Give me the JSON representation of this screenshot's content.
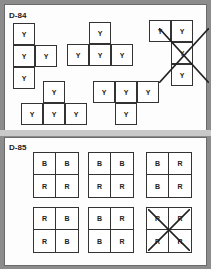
{
  "panels": [
    {
      "id": "D-84",
      "label": "D-84",
      "shapes": [
        {
          "name": "net-column-right-arm",
          "cells": [
            {
              "x": 13,
              "y": 23,
              "text": "Y"
            },
            {
              "x": 13,
              "y": 45,
              "text": "Y"
            },
            {
              "x": 35,
              "y": 45,
              "text": "Y"
            },
            {
              "x": 13,
              "y": 67,
              "text": "Y"
            }
          ],
          "crossed": false
        },
        {
          "name": "net-t-up-top",
          "cells": [
            {
              "x": 89,
              "y": 22,
              "text": "Y"
            },
            {
              "x": 67,
              "y": 44,
              "text": "Y"
            },
            {
              "x": 89,
              "y": 44,
              "text": "Y"
            },
            {
              "x": 111,
              "y": 44,
              "text": "Y"
            }
          ],
          "crossed": false
        },
        {
          "name": "net-crossed",
          "cells": [
            {
              "x": 149,
              "y": 20,
              "text": "Y"
            },
            {
              "x": 171,
              "y": 20,
              "text": "Y"
            },
            {
              "x": 171,
              "y": 42,
              "text": "Y"
            },
            {
              "x": 171,
              "y": 64,
              "text": "Y"
            }
          ],
          "crossed": true
        },
        {
          "name": "net-t-up-bottom",
          "cells": [
            {
              "x": 43,
              "y": 81,
              "text": "Y"
            },
            {
              "x": 21,
              "y": 103,
              "text": "Y"
            },
            {
              "x": 43,
              "y": 103,
              "text": "Y"
            },
            {
              "x": 65,
              "y": 103,
              "text": "Y"
            }
          ],
          "crossed": false
        },
        {
          "name": "net-t-down",
          "cells": [
            {
              "x": 93,
              "y": 81,
              "text": "Y"
            },
            {
              "x": 115,
              "y": 81,
              "text": "Y"
            },
            {
              "x": 137,
              "y": 81,
              "text": "Y"
            },
            {
              "x": 115,
              "y": 103,
              "text": "Y"
            }
          ],
          "crossed": false
        }
      ]
    },
    {
      "id": "D-85",
      "label": "D-85",
      "squares": [
        {
          "x": 33,
          "y": 152,
          "cells": [
            "B",
            "B",
            "R",
            "R"
          ],
          "crossed": false
        },
        {
          "x": 88,
          "y": 152,
          "cells": [
            "B",
            "B",
            "R",
            "R"
          ],
          "crossed": false
        },
        {
          "x": 146,
          "y": 152,
          "cells": [
            "B",
            "R",
            "B",
            "R"
          ],
          "crossed": false
        },
        {
          "x": 33,
          "y": 207,
          "cells": [
            "R",
            "B",
            "R",
            "B"
          ],
          "crossed": false
        },
        {
          "x": 88,
          "y": 207,
          "cells": [
            "B",
            "R",
            "B",
            "R"
          ],
          "crossed": false
        },
        {
          "x": 146,
          "y": 207,
          "cells": [
            "R",
            "R",
            "R",
            "R"
          ],
          "crossed": true
        }
      ]
    }
  ],
  "colors": {
    "frame": "#8c8c8c",
    "panel": "#fdfdfd",
    "line": "#333333"
  }
}
